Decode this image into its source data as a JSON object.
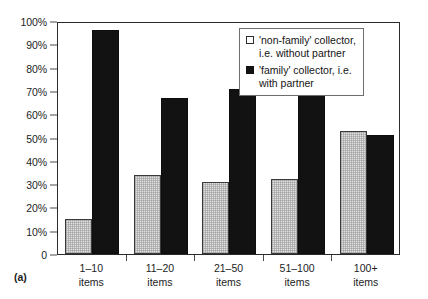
{
  "figure": {
    "label": "(a)"
  },
  "legend": {
    "items": [
      {
        "label": "'non-family' collector,\ni.e. without partner",
        "swatch": "light-open-square-icon"
      },
      {
        "label": "'family' collector, i.e.\nwith partner",
        "swatch": "dark-filled-square-icon"
      }
    ]
  },
  "axes": {
    "y_ticks": [
      "100%",
      "90%",
      "80%",
      "70%",
      "60%",
      "50%",
      "40%",
      "30%",
      "20%",
      "10%",
      "0"
    ],
    "x_labels": [
      "1–10\nitems",
      "11–20\nitems",
      "21–50\nitems",
      "51–100\nitems",
      "100+\nitems"
    ]
  },
  "chart_data": {
    "type": "bar",
    "title": "",
    "subtitle": "",
    "xlabel": "",
    "ylabel": "",
    "ylim": [
      0,
      100
    ],
    "y_tick_values": [
      0,
      10,
      20,
      30,
      40,
      50,
      60,
      70,
      80,
      90,
      100
    ],
    "grid": false,
    "legend_position": "top-right",
    "categories": [
      "1–10 items",
      "11–20 items",
      "21–50 items",
      "51–100 items",
      "100+ items"
    ],
    "series": [
      {
        "name": "'non-family' collector, i.e. without partner",
        "color": "#e2e2e2",
        "values": [
          15,
          34,
          31,
          32,
          53
        ]
      },
      {
        "name": "'family' collector, i.e. with partner",
        "color": "#121212",
        "values": [
          96,
          67,
          71,
          70,
          51
        ]
      }
    ]
  }
}
